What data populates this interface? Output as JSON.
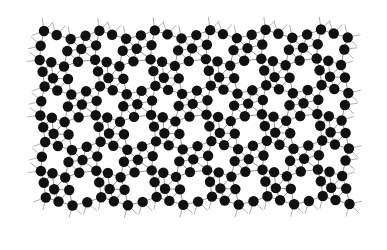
{
  "diagram": {
    "type": "periodic-lattice",
    "colors": {
      "background": "#ffffff",
      "atom": "#111111",
      "bond": "#8a8a8a",
      "stub": "#9a9a9a"
    },
    "atom_radius": 5.2,
    "bond_cutoff": 18.5,
    "lattice": {
      "origin": [
        44,
        31
      ],
      "a": [
        55.4,
        -0.3
      ],
      "b": [
        0.6,
        55.5
      ],
      "cols": [
        -1,
        6
      ],
      "rows": [
        -1,
        4
      ],
      "bounds": {
        "xmin": 36,
        "xmax": 353,
        "ymin": 28,
        "ymax": 208
      }
    },
    "motif": [
      [
        0,
        0
      ],
      [
        12.7,
        4
      ],
      [
        26.7,
        8
      ],
      [
        41.5,
        4.7
      ],
      [
        -3.3,
        14.7
      ],
      [
        23.3,
        20
      ],
      [
        37.3,
        18
      ],
      [
        -4.3,
        29
      ],
      [
        7.3,
        31.3
      ],
      [
        20,
        35.5
      ],
      [
        34,
        30.7
      ],
      [
        9,
        47.3
      ],
      [
        24,
        48
      ],
      [
        -1.4,
        40.7
      ]
    ],
    "stub_length": 13
  }
}
